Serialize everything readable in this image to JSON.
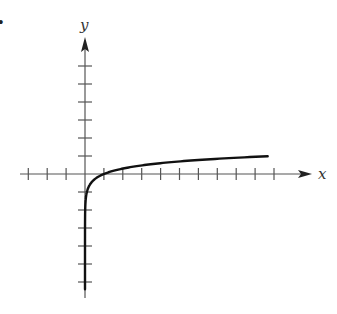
{
  "bullet": "•",
  "chart_data": {
    "type": "line",
    "title": "",
    "xlabel": "x",
    "ylabel": "y",
    "function": "y = log10(x)",
    "x_ticks_negative": 3,
    "x_ticks_positive": 10,
    "y_ticks_positive": 6,
    "y_ticks_negative": 6,
    "xlim": [
      -3.4,
      11.7
    ],
    "ylim": [
      -6.9,
      7.6
    ],
    "grid": false,
    "legend": null,
    "series": [
      {
        "name": "log curve",
        "x": [
          0.0001,
          0.001,
          0.01,
          0.05,
          0.1,
          0.2,
          0.5,
          1,
          2,
          3,
          4,
          5,
          6,
          7,
          8,
          9,
          10
        ],
        "y": [
          -4,
          -3,
          -2,
          -1.3,
          -1,
          -0.7,
          -0.3,
          0,
          0.3,
          0.48,
          0.6,
          0.7,
          0.78,
          0.85,
          0.9,
          0.95,
          1
        ]
      }
    ],
    "colors": {
      "axis": "#555555",
      "curve": "#111111"
    }
  }
}
